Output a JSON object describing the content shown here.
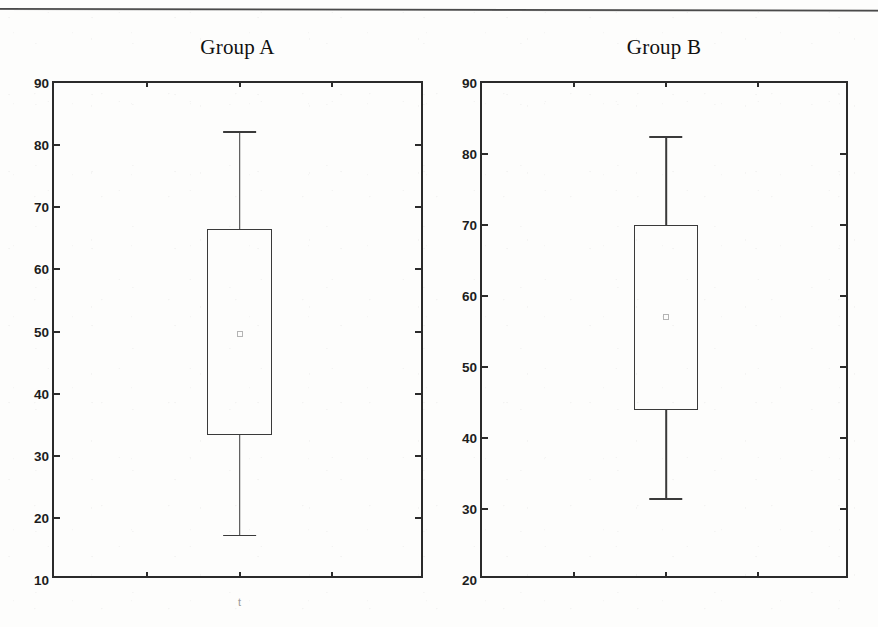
{
  "figure": {
    "background_color": "#fdfdfc",
    "axis_color": "#2b2b2b",
    "box_color": "#3a3a3a",
    "mean_marker_color": "#b4b4b4",
    "top_rule": "page-separator-rule"
  },
  "panels": [
    {
      "id": "group-a",
      "title": "Group A",
      "x_axis_mark": "t",
      "frame": {
        "left": 52,
        "top": 81,
        "width": 371,
        "height": 497
      },
      "y_ticks": [
        "90",
        "80",
        "70",
        "60",
        "50",
        "40",
        "30",
        "20",
        "10"
      ],
      "x_tick_fractions": [
        0.25,
        0.5,
        0.75
      ]
    },
    {
      "id": "group-b",
      "title": "Group B",
      "x_axis_mark": "",
      "frame": {
        "left": 480,
        "top": 81,
        "width": 368,
        "height": 497
      },
      "y_ticks": [
        "90",
        "80",
        "70",
        "60",
        "50",
        "40",
        "30",
        "20"
      ],
      "x_tick_fractions": [
        0.25,
        0.5,
        0.75
      ]
    }
  ],
  "chart_data": {
    "type": "box",
    "title": "",
    "xlabel": "",
    "ylabel": "",
    "panels": [
      {
        "name": "Group A",
        "ylim": [
          10,
          90
        ],
        "ytick_step": 10,
        "grid": false,
        "center_fraction": 0.5,
        "box_width_fraction": 0.175,
        "stats": {
          "whisker_low": 17.3,
          "q1": 33.4,
          "median": null,
          "mean": 49.6,
          "q3": 66.5,
          "whisker_high": 82.3
        }
      },
      {
        "name": "Group B",
        "ylim": [
          20,
          90
        ],
        "ytick_step": 10,
        "grid": false,
        "center_fraction": 0.5,
        "box_width_fraction": 0.175,
        "stats": {
          "whisker_low": 31.5,
          "q1": 44.0,
          "median": null,
          "mean": 57.0,
          "q3": 70.0,
          "whisker_high": 82.5
        }
      }
    ],
    "legend": null,
    "legend_position": "none",
    "annotations": []
  }
}
